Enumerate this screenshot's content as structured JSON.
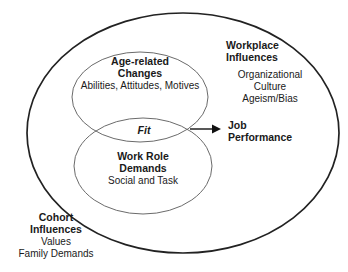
{
  "figure": {
    "type": "venn-ellipse-conceptual-diagram",
    "background_color": "#ffffff",
    "stroke_outer_color": "#222222",
    "stroke_inner_color": "#6b6b6b",
    "text_color": "#1a1a1a"
  },
  "outer_boundary": {
    "name": "context-ellipse",
    "shape": "ellipse"
  },
  "circles": {
    "top": {
      "title_line1": "Age-related",
      "title_line2": "Changes",
      "subtitle": "Abilities, Attitudes, Motives"
    },
    "bottom": {
      "title_line1": "Work Role",
      "title_line2": "Demands",
      "subtitle": "Social and Task"
    },
    "overlap_label": "Fit"
  },
  "outcome": {
    "title_line1": "Job",
    "title_line2": "Performance",
    "arrow": "arrow-right"
  },
  "workplace_influences": {
    "title_line1": "Workplace",
    "title_line2": "Influences",
    "items": [
      "Organizational",
      "Culture",
      "Ageism/Bias"
    ]
  },
  "cohort_influences": {
    "title_line1": "Cohort",
    "title_line2": "Influences",
    "items": [
      "Values",
      "Family Demands"
    ]
  }
}
